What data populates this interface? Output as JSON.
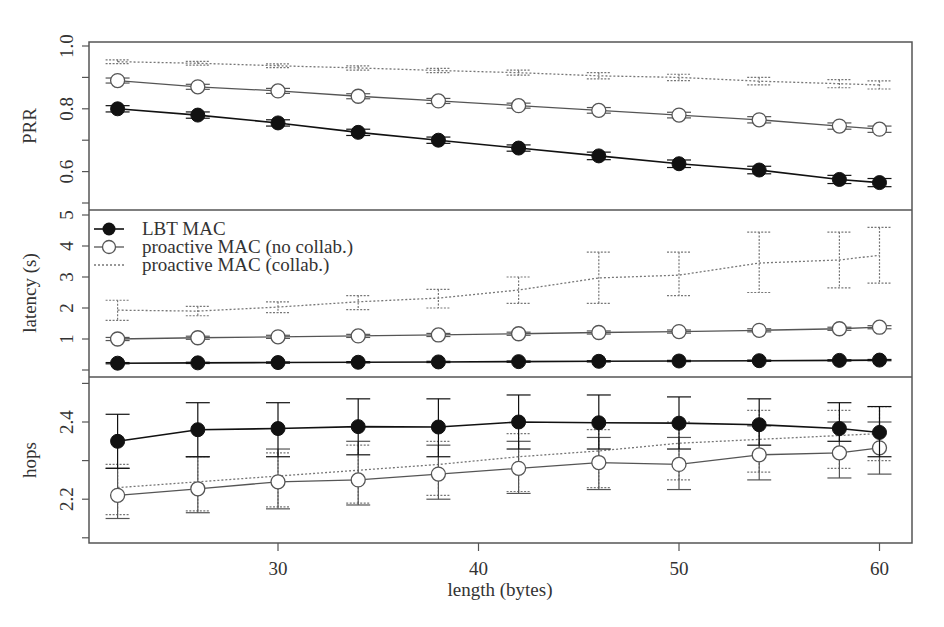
{
  "chart_data": {
    "type": "line",
    "layout": "three vertically stacked panels sharing x-axis, with error bars",
    "xlabel": "length (bytes)",
    "x": [
      22,
      26,
      30,
      34,
      38,
      42,
      46,
      50,
      54,
      58,
      60
    ],
    "xticks": [
      30,
      40,
      50,
      60
    ],
    "xlim": [
      20.5,
      61.6
    ],
    "legend": {
      "position": "top-left of latency panel",
      "entries": [
        {
          "label": "LBT MAC",
          "marker": "filled-circle",
          "line": "solid"
        },
        {
          "label": "proactive MAC (no collab.)",
          "marker": "open-circle",
          "line": "solid"
        },
        {
          "label": "proactive MAC (collab.)",
          "marker": "none",
          "line": "dotted"
        }
      ]
    },
    "panels": [
      {
        "name": "prr",
        "ylabel": "PRR",
        "yticks": [
          0.6,
          0.8,
          1.0
        ],
        "yminor": [
          0.5,
          0.7,
          0.9
        ],
        "ylim": [
          0.49,
          1.01
        ],
        "series": [
          {
            "name": "LBT MAC",
            "values": [
              0.8,
              0.78,
              0.755,
              0.725,
              0.7,
              0.675,
              0.65,
              0.625,
              0.605,
              0.575,
              0.565
            ],
            "err": [
              0.01,
              0.01,
              0.01,
              0.01,
              0.01,
              0.01,
              0.012,
              0.012,
              0.012,
              0.013,
              0.013
            ]
          },
          {
            "name": "proactive MAC (no collab.)",
            "values": [
              0.89,
              0.87,
              0.857,
              0.84,
              0.825,
              0.81,
              0.795,
              0.78,
              0.765,
              0.745,
              0.735
            ],
            "err": [
              0.008,
              0.008,
              0.008,
              0.008,
              0.008,
              0.008,
              0.009,
              0.009,
              0.01,
              0.01,
              0.01
            ]
          },
          {
            "name": "proactive MAC (collab.)",
            "values": [
              0.95,
              0.945,
              0.937,
              0.93,
              0.922,
              0.915,
              0.905,
              0.9,
              0.888,
              0.88,
              0.876
            ],
            "err": [
              0.006,
              0.006,
              0.006,
              0.007,
              0.007,
              0.008,
              0.01,
              0.01,
              0.012,
              0.013,
              0.013
            ]
          }
        ]
      },
      {
        "name": "latency",
        "ylabel": "latency (s)",
        "yticks": [
          1,
          2,
          3,
          4,
          5
        ],
        "ylim": [
          -0.2,
          5.2
        ],
        "series": [
          {
            "name": "LBT MAC",
            "values": [
              0.22,
              0.23,
              0.24,
              0.25,
              0.26,
              0.27,
              0.28,
              0.29,
              0.3,
              0.31,
              0.32
            ],
            "err": [
              0.02,
              0.02,
              0.02,
              0.02,
              0.02,
              0.02,
              0.02,
              0.02,
              0.02,
              0.02,
              0.02
            ]
          },
          {
            "name": "proactive MAC (no collab.)",
            "values": [
              1.0,
              1.04,
              1.07,
              1.1,
              1.13,
              1.17,
              1.21,
              1.24,
              1.28,
              1.33,
              1.38
            ],
            "err": [
              0.05,
              0.05,
              0.05,
              0.05,
              0.05,
              0.05,
              0.05,
              0.05,
              0.05,
              0.05,
              0.05
            ]
          },
          {
            "name": "proactive MAC (collab.)",
            "values": [
              1.93,
              1.9,
              2.03,
              2.2,
              2.32,
              2.58,
              2.97,
              3.06,
              3.45,
              3.55,
              3.7
            ],
            "lo": [
              1.6,
              1.75,
              1.85,
              1.95,
              2.0,
              2.15,
              2.15,
              2.4,
              2.5,
              2.65,
              2.8
            ],
            "hi": [
              2.25,
              2.05,
              2.2,
              2.4,
              2.6,
              3.0,
              3.8,
              3.8,
              4.45,
              4.45,
              4.6
            ]
          }
        ]
      },
      {
        "name": "hops",
        "ylabel": "hops",
        "yticks": [
          2.2,
          2.4
        ],
        "yminor": [
          2.1,
          2.3,
          2.5
        ],
        "ylim": [
          2.09,
          2.52
        ],
        "series": [
          {
            "name": "LBT MAC",
            "values": [
              2.35,
              2.38,
              2.383,
              2.388,
              2.387,
              2.4,
              2.398,
              2.397,
              2.393,
              2.383,
              2.373
            ],
            "lo": [
              2.28,
              2.31,
              2.31,
              2.315,
              2.31,
              2.33,
              2.33,
              2.33,
              2.34,
              2.35,
              2.31
            ],
            "hi": [
              2.42,
              2.45,
              2.45,
              2.46,
              2.46,
              2.47,
              2.47,
              2.465,
              2.46,
              2.45,
              2.44
            ]
          },
          {
            "name": "proactive MAC (no collab.)",
            "values": [
              2.21,
              2.227,
              2.245,
              2.25,
              2.265,
              2.28,
              2.295,
              2.29,
              2.315,
              2.32,
              2.333
            ],
            "lo": [
              2.15,
              2.165,
              2.175,
              2.185,
              2.2,
              2.215,
              2.225,
              2.225,
              2.25,
              2.255,
              2.265
            ],
            "hi": [
              2.28,
              2.31,
              2.33,
              2.35,
              2.34,
              2.35,
              2.36,
              2.36,
              2.39,
              2.4,
              2.4
            ]
          },
          {
            "name": "proactive MAC (collab.)",
            "values": [
              2.23,
              2.245,
              2.26,
              2.275,
              2.29,
              2.31,
              2.325,
              2.345,
              2.355,
              2.365,
              2.37
            ],
            "lo": [
              2.16,
              2.17,
              2.18,
              2.19,
              2.21,
              2.22,
              2.23,
              2.25,
              2.27,
              2.28,
              2.3
            ],
            "hi": [
              2.29,
              2.31,
              2.32,
              2.34,
              2.35,
              2.37,
              2.38,
              2.4,
              2.43,
              2.43,
              2.44
            ]
          }
        ]
      }
    ]
  },
  "colors": {
    "frame": "#555555",
    "lbt": "#111111",
    "no_collab": "#555555",
    "collab": "#777777",
    "text": "#333333"
  }
}
